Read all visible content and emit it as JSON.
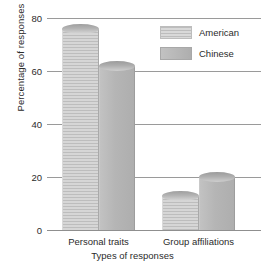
{
  "chart_data": {
    "type": "bar",
    "title": "",
    "xlabel": "Types of responses",
    "ylabel": "Percentage of responses",
    "categories": [
      "Personal traits",
      "Group affiliations"
    ],
    "series": [
      {
        "name": "American",
        "values": [
          76,
          13
        ],
        "color": "#d0d0d0"
      },
      {
        "name": "Chinese",
        "values": [
          62,
          20
        ],
        "color": "#b4b4b4"
      }
    ],
    "ylim": [
      0,
      80
    ],
    "yticks": [
      0,
      20,
      40,
      60,
      80
    ],
    "ytick_labels": [
      "0",
      "20",
      "40",
      "60",
      "80"
    ],
    "grid": true,
    "legend_position": "top-right"
  },
  "legend": {
    "items": [
      {
        "label": "American"
      },
      {
        "label": "Chinese"
      }
    ]
  }
}
